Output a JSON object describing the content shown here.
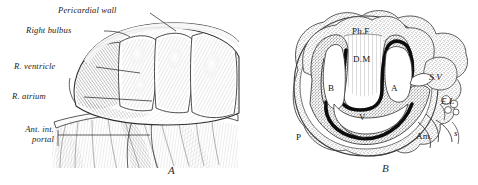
{
  "figure": {
    "caption_letters": {
      "left": "A",
      "right": "B"
    },
    "ink": "#1d1d1d",
    "stipple": "#7d7d7d",
    "background": "#ffffff"
  },
  "panel_a": {
    "name": "Ventral view of embryonic heart within opened pericardium",
    "labels": [
      {
        "id": "pericardial-wall",
        "text": "Pericardial wall",
        "lines": [
          "Pericardial wall"
        ]
      },
      {
        "id": "right-bulbus",
        "text": "Right bulbus",
        "lines": [
          "Right bulbus"
        ]
      },
      {
        "id": "r-ventricle",
        "text": "R. ventricle",
        "lines": [
          "R. ventricle"
        ]
      },
      {
        "id": "r-atrium",
        "text": "R. atrium",
        "lines": [
          "R. atrium"
        ]
      },
      {
        "id": "ant-int-portal",
        "text": "Ant. int. portal",
        "lines": [
          "Ant. int.",
          "portal"
        ]
      }
    ]
  },
  "panel_b": {
    "name": "Transverse section through heart and pericardial cavity",
    "labels": [
      {
        "id": "ph-f",
        "text": "Ph.F",
        "meaning": "pharyngeal floor"
      },
      {
        "id": "d-m",
        "text": "D.M",
        "meaning": "dorsal mesocardium"
      },
      {
        "id": "b",
        "text": "B",
        "meaning": "bulbus"
      },
      {
        "id": "a",
        "text": "A",
        "meaning": "atrium"
      },
      {
        "id": "s-v",
        "text": "S.V",
        "meaning": "sinus venosus"
      },
      {
        "id": "e-l",
        "text": "E.L",
        "meaning": "ectoderm layer"
      },
      {
        "id": "v",
        "text": "V",
        "meaning": "ventricle"
      },
      {
        "id": "p",
        "text": "P",
        "meaning": "pericardium"
      },
      {
        "id": "am",
        "text": "Am.",
        "meaning": "amnion"
      },
      {
        "id": "s",
        "text": "s",
        "meaning": "somatopleure"
      }
    ]
  }
}
